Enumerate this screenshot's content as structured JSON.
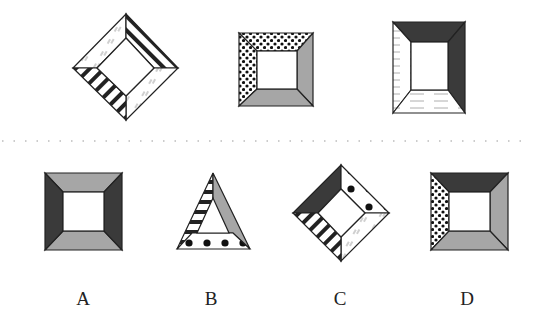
{
  "puzzle": {
    "question_figures": [
      {
        "id": "q1",
        "shape": "diamond-frame",
        "faces": {
          "top_left": "light-hatch",
          "top_right": "stripes",
          "bottom_right": "light-hatch",
          "bottom_left": "stripes"
        }
      },
      {
        "id": "q2",
        "shape": "square-frame",
        "faces": {
          "top": "dots",
          "left": "dots",
          "right": "gray",
          "bottom": "gray"
        }
      },
      {
        "id": "q3",
        "shape": "rect-frame",
        "faces": {
          "top": "dark",
          "right": "dark",
          "left": "wood-lines",
          "bottom": "wood-lines"
        }
      }
    ],
    "separator": "dotted-line",
    "options": [
      {
        "label": "A",
        "shape": "square-frame",
        "faces": {
          "top": "gray",
          "bottom": "gray",
          "left": "dark",
          "right": "dark"
        }
      },
      {
        "label": "B",
        "shape": "triangle-frame",
        "faces": {
          "left": "stripes",
          "right": "gray",
          "bottom": "big-dots"
        }
      },
      {
        "label": "C",
        "shape": "diamond-frame",
        "faces": {
          "top_left": "dark",
          "top_right": "big-dots",
          "bottom_right": "light-hatch",
          "bottom_left": "stripes"
        }
      },
      {
        "label": "D",
        "shape": "square-frame",
        "faces": {
          "top": "dark",
          "left": "dots",
          "right": "gray",
          "bottom": "gray"
        }
      }
    ],
    "colors": {
      "dark": "#3a3a3a",
      "gray": "#a6a6a6",
      "stroke": "#222222",
      "background": "#ffffff"
    }
  }
}
